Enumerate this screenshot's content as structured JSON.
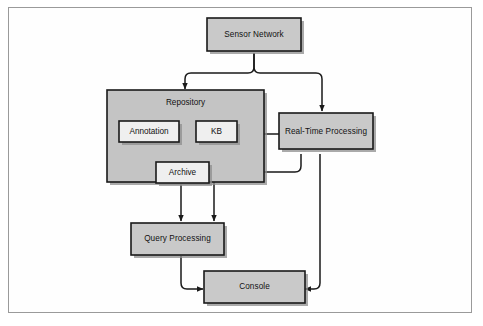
{
  "figure": {
    "background_color": "#ffffff",
    "frame_border_color": "#9a9a9a"
  },
  "palette": {
    "node_fill": "#c9c9c9",
    "group_fill": "#c4c4c4",
    "inner_fill": "#efefef",
    "stroke": "#1a1a1a",
    "shadow": "#8e8e8e"
  },
  "nodes": {
    "sensor_network": {
      "label": "Sensor Network"
    },
    "repository": {
      "label": "Repository"
    },
    "annotation": {
      "label": "Annotation"
    },
    "kb": {
      "label": "KB"
    },
    "archive": {
      "label": "Archive"
    },
    "real_time_processing": {
      "label": "Real-Time Processing"
    },
    "query_processing": {
      "label": "Query Processing"
    },
    "console": {
      "label": "Console"
    }
  },
  "edges": [
    {
      "id": "sensor-to-repository",
      "from": "Sensor Network",
      "to": "Repository"
    },
    {
      "id": "sensor-to-real-time-processing",
      "from": "Sensor Network",
      "to": "Real-Time Processing"
    },
    {
      "id": "real-time-processing-to-kb",
      "from": "Real-Time Processing",
      "to": "KB"
    },
    {
      "id": "real-time-processing-to-archive",
      "from": "Real-Time Processing",
      "to": "Archive"
    },
    {
      "id": "real-time-processing-to-console",
      "from": "Real-Time Processing",
      "to": "Console"
    },
    {
      "id": "kb-to-query-processing",
      "from": "KB",
      "to": "Query Processing"
    },
    {
      "id": "archive-to-query-processing",
      "from": "Archive",
      "to": "Query Processing"
    },
    {
      "id": "query-processing-to-console",
      "from": "Query Processing",
      "to": "Console"
    }
  ]
}
